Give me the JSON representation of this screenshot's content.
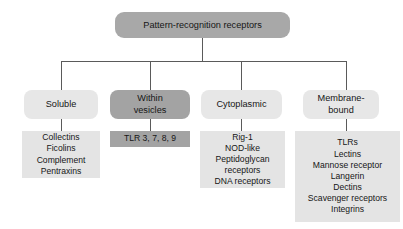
{
  "figure": {
    "root": {
      "label": "Pattern-recognition receptors",
      "fill": "#a8a8a8"
    },
    "branches": [
      {
        "id": "soluble",
        "label": "Soluble",
        "style": "light",
        "fill": "#e7e7e7",
        "items": [
          "Collectins",
          "Ficolins",
          "Complement",
          "Pentraxins"
        ]
      },
      {
        "id": "within-vesicles",
        "label": "Within vesicles",
        "label_line1": "Within",
        "label_line2": "vesicles",
        "style": "dark",
        "fill": "#a3a3a3",
        "items": [
          "TLR 3, 7, 8, 9"
        ]
      },
      {
        "id": "cytoplasmic",
        "label": "Cytoplasmic",
        "style": "light",
        "fill": "#e7e7e7",
        "items": [
          "Rig-1",
          "NOD-like",
          "Peptidoglycan",
          "receptors",
          "DNA receptors"
        ]
      },
      {
        "id": "membrane-bound",
        "label": "Membrane-bound",
        "label_line1": "Membrane-",
        "label_line2": "bound",
        "style": "light",
        "fill": "#e7e7e7",
        "items": [
          "TLRs",
          "Lectins",
          "Mannose receptor",
          "Langerin",
          "Dectins",
          "Scavenger receptors",
          "Integrins"
        ]
      }
    ],
    "connector_color": "#5a5a5a"
  }
}
